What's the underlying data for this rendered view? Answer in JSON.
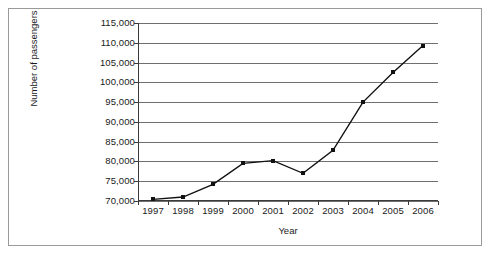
{
  "chart_data": {
    "type": "line",
    "title": "",
    "xlabel": "Year",
    "ylabel": "Number of passengers",
    "categories": [
      "1997",
      "1998",
      "1999",
      "2000",
      "2001",
      "2002",
      "2003",
      "2004",
      "2005",
      "2006"
    ],
    "values": [
      70400,
      71000,
      74200,
      79500,
      80200,
      77000,
      82800,
      95000,
      102500,
      109300
    ],
    "ylim": [
      70000,
      115000
    ],
    "ytick_step": 5000,
    "ytick_labels": [
      "70,000",
      "75,000",
      "80,000",
      "85,000",
      "90,000",
      "95,000",
      "100,000",
      "105,000",
      "110,000",
      "115,000"
    ],
    "ytick_values": [
      70000,
      75000,
      80000,
      85000,
      90000,
      95000,
      100000,
      105000,
      110000,
      115000
    ],
    "grid": true,
    "legend": "none",
    "marker": "square",
    "line_color": "#111111",
    "grid_color": "#6f6f6f",
    "axis_color": "#3a3a3a"
  }
}
